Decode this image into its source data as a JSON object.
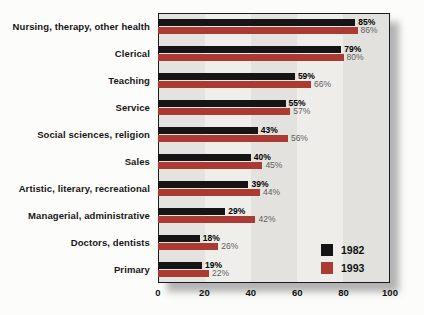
{
  "chart_data": {
    "type": "bar",
    "orientation": "horizontal",
    "title": "",
    "xlabel": "",
    "ylabel": "",
    "categories": [
      "Nursing, therapy, other health",
      "Clerical",
      "Teaching",
      "Service",
      "Social sciences, religion",
      "Sales",
      "Artistic, literary, recreational",
      "Managerial, administrative",
      "Doctors, dentists",
      "Primary"
    ],
    "series": [
      {
        "name": "1982",
        "color": "#151515",
        "label_color": "#000000",
        "label_weight": "700",
        "values": [
          85,
          79,
          59,
          55,
          43,
          40,
          39,
          29,
          18,
          19
        ]
      },
      {
        "name": "1993",
        "color": "#ab3b32",
        "label_color": "#5e5e5e",
        "label_weight": "400",
        "values": [
          86,
          80,
          66,
          57,
          56,
          45,
          44,
          42,
          26,
          22
        ]
      }
    ],
    "value_suffix": "%",
    "xlim": [
      0,
      100
    ],
    "x_ticks": [
      0,
      20,
      40,
      60,
      80,
      100
    ],
    "grid": "vertical-bands",
    "legend": {
      "position": "inside-bottom-right",
      "entries": [
        "1982",
        "1993"
      ]
    }
  }
}
